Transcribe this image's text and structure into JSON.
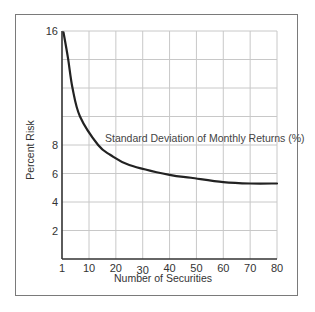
{
  "chart_data": {
    "type": "line",
    "title": "",
    "xlabel": "Number of Securities",
    "ylabel": "Percent Risk",
    "x_ticks": [
      "1",
      "10",
      "20",
      "30",
      "40",
      "50",
      "60",
      "70",
      "80"
    ],
    "y_ticks": [
      "2",
      "4",
      "6",
      "8",
      "16"
    ],
    "y_gridlines": [
      2,
      4,
      6,
      8,
      10,
      12,
      14,
      16
    ],
    "xlim": [
      1,
      80
    ],
    "ylim": [
      0,
      16
    ],
    "grid": true,
    "series": [
      {
        "name": "Standard Deviation of Monthly Returns (%)",
        "x": [
          1.5,
          3,
          4.5,
          7,
          13.4,
          18,
          25,
          40,
          48,
          60,
          70,
          80
        ],
        "values": [
          15.9,
          14.1,
          12.0,
          10.0,
          8.0,
          7.3,
          6.6,
          5.9,
          5.7,
          5.4,
          5.3,
          5.3
        ]
      }
    ],
    "annotation": "Standard Deviation of Monthly Returns (%)"
  }
}
